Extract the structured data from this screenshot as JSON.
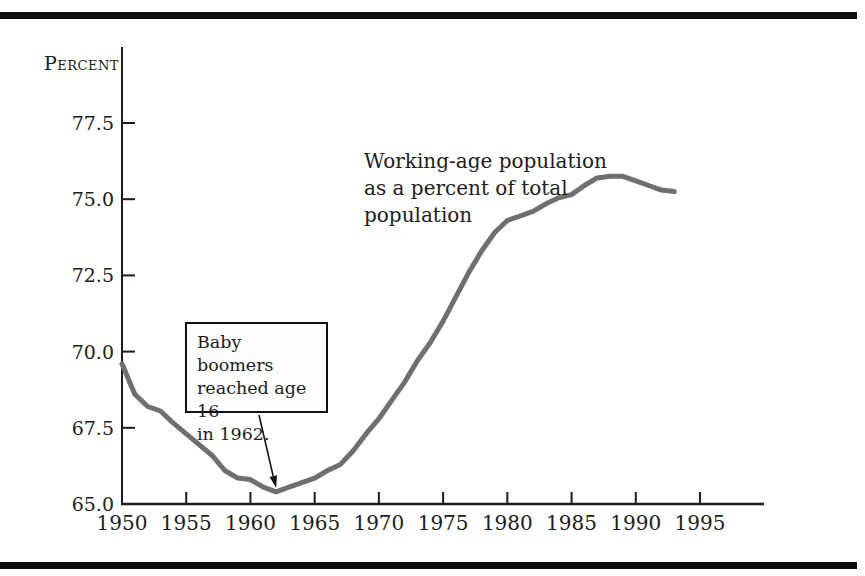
{
  "figure": {
    "y_axis_title": "Percent",
    "series_annotation": "Working-age population\nas a percent of total\npopulation",
    "callout_text": "Baby boomers\nreached age 16\nin 1962."
  },
  "chart_data": {
    "type": "line",
    "title": "Working-age population as a percent of total population",
    "xlabel": "",
    "ylabel": "Percent",
    "x": [
      1950,
      1951,
      1952,
      1953,
      1954,
      1955,
      1956,
      1957,
      1958,
      1959,
      1960,
      1961,
      1962,
      1963,
      1964,
      1965,
      1966,
      1967,
      1968,
      1969,
      1970,
      1971,
      1972,
      1973,
      1974,
      1975,
      1976,
      1977,
      1978,
      1979,
      1980,
      1981,
      1982,
      1983,
      1984,
      1985,
      1986,
      1987,
      1988,
      1989,
      1990,
      1991,
      1992,
      1993
    ],
    "series": [
      {
        "name": "Working-age population as a percent of total population",
        "values": [
          69.6,
          68.6,
          68.2,
          68.05,
          67.65,
          67.3,
          66.95,
          66.6,
          66.1,
          65.85,
          65.8,
          65.55,
          65.4,
          65.55,
          65.7,
          65.85,
          66.1,
          66.3,
          66.75,
          67.3,
          67.8,
          68.4,
          69.0,
          69.7,
          70.3,
          71.0,
          71.8,
          72.6,
          73.3,
          73.9,
          74.3,
          74.45,
          74.6,
          74.85,
          75.05,
          75.15,
          75.45,
          75.7,
          75.75,
          75.75,
          75.6,
          75.45,
          75.3,
          75.25
        ]
      }
    ],
    "x_ticks": [
      1950,
      1955,
      1960,
      1965,
      1970,
      1975,
      1980,
      1985,
      1990,
      1995
    ],
    "y_ticks": [
      "65.0",
      "67.5",
      "70.0",
      "72.5",
      "75.0",
      "77.5"
    ],
    "xlim": [
      1950,
      2000
    ],
    "ylim": [
      65.0,
      79.0
    ],
    "grid": false,
    "legend_position": "none",
    "line_color": "#6f6f6f",
    "axis_color": "#1c1c1c",
    "annotation": {
      "text": "Baby boomers reached age 16 in 1962.",
      "target_year": 1962,
      "target_value": 65.4
    }
  }
}
